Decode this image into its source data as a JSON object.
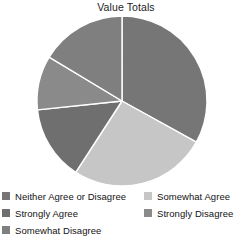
{
  "chart_data": {
    "type": "pie",
    "title": "Value Totals",
    "xlabel": "",
    "ylabel": "",
    "legend_position": "bottom",
    "grid": false,
    "categories": [
      "Neither Agree or Disagree",
      "Somewhat Agree",
      "Strongly Agree",
      "Strongly Disagree",
      "Somewhat Disagree"
    ],
    "values": [
      33,
      26,
      14,
      10,
      17
    ],
    "slices": [
      {
        "label": "Neither Agree or Disagree",
        "value": 33,
        "percent": 33,
        "start_angle": 0,
        "end_angle": 119,
        "color": "#767676"
      },
      {
        "label": "Somewhat Agree",
        "value": 26,
        "percent": 26,
        "start_angle": 119,
        "end_angle": 213,
        "color": "#c6c6c6"
      },
      {
        "label": "Strongly Agree",
        "value": 14,
        "percent": 14,
        "start_angle": 213,
        "end_angle": 264,
        "color": "#6f6f6f"
      },
      {
        "label": "Strongly Disagree",
        "value": 10,
        "percent": 10,
        "start_angle": 264,
        "end_angle": 301,
        "color": "#8a8a8a"
      },
      {
        "label": "Somewhat Disagree",
        "value": 17,
        "percent": 17,
        "start_angle": 301,
        "end_angle": 360,
        "color": "#7f7f7f"
      }
    ],
    "geometry": {
      "center_x": 122,
      "center_y": 101,
      "radius": 85,
      "separator_color": "#ffffff",
      "separator_width": 1.4
    }
  },
  "legend": {
    "columns": [
      {
        "items": [
          {
            "label": "Neither Agree or Disagree",
            "color": "#767676"
          },
          {
            "label": "Strongly Agree",
            "color": "#6f6f6f"
          },
          {
            "label": "Somewhat Disagree",
            "color": "#7f7f7f"
          }
        ]
      },
      {
        "items": [
          {
            "label": "Somewhat Agree",
            "color": "#c6c6c6"
          },
          {
            "label": "Strongly Disagree",
            "color": "#8a8a8a"
          }
        ]
      }
    ]
  },
  "colors": {
    "background": "#ffffff",
    "text": "#131313",
    "title": "#1c1c1c"
  }
}
